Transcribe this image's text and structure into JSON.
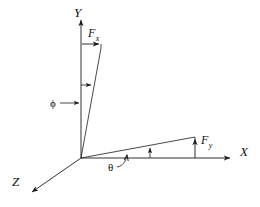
{
  "figure": {
    "type": "vector-diagram",
    "background_color": "#ffffff",
    "line_color": "#1a1a1a"
  },
  "axes": [
    {
      "id": "y",
      "label": "Y",
      "direction": "up",
      "label_x": 74,
      "label_y": 6
    },
    {
      "id": "x",
      "label": "X",
      "direction": "right",
      "label_x": 240,
      "label_y": 145
    },
    {
      "id": "z",
      "label": "Z",
      "direction": "down-left",
      "label_x": 12,
      "label_y": 175
    }
  ],
  "vectors": [
    {
      "id": "fx",
      "label": "F",
      "subscript": "x",
      "orientation": "horizontal-right",
      "label_x": 88,
      "label_y": 27
    },
    {
      "id": "fy",
      "label": "F",
      "subscript": "y",
      "orientation": "vertical-up",
      "label_x": 201,
      "label_y": 134
    }
  ],
  "angles": [
    {
      "id": "phi",
      "label": "ϕ",
      "between": "Y-axis and upper vector",
      "label_x": 50,
      "label_y": 98
    },
    {
      "id": "theta",
      "label": "θ",
      "between": "X-axis and XZ-plane vector",
      "label_x": 108,
      "label_y": 162
    }
  ],
  "geometry": {
    "origin": {
      "x": 81,
      "y": 158
    },
    "y_axis_tip": {
      "x": 81,
      "y": 17
    },
    "x_axis_tip": {
      "x": 233,
      "y": 158
    },
    "z_axis_tip": {
      "x": 30,
      "y": 194
    },
    "upper_vector_tip": {
      "x": 101,
      "y": 48
    },
    "plane_vector_tip": {
      "x": 195,
      "y": 137
    }
  }
}
